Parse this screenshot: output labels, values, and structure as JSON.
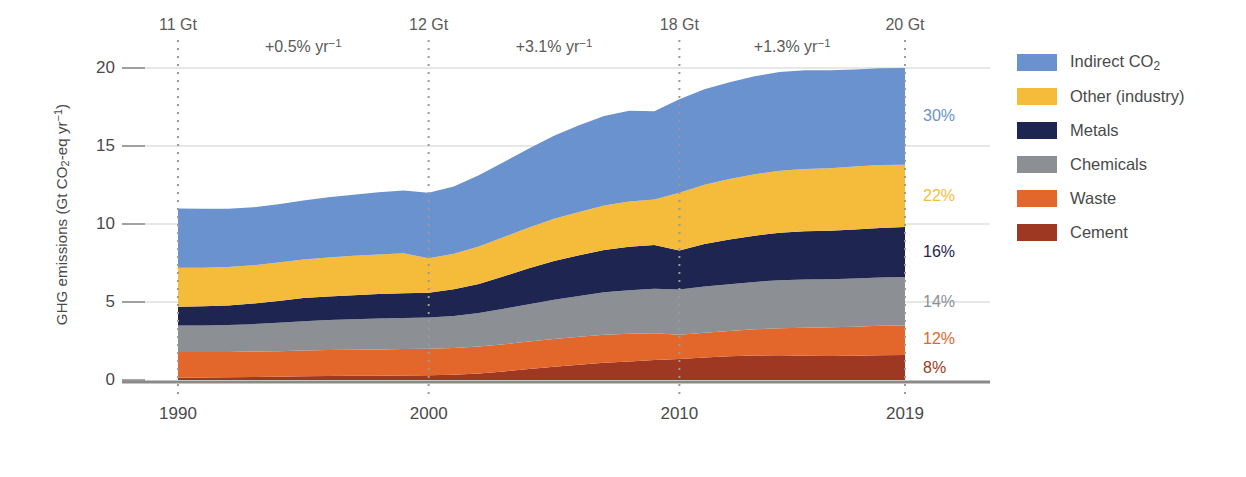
{
  "chart_data": {
    "type": "area",
    "stacked": true,
    "title": "",
    "xlabel": "",
    "ylabel": "GHG emissions (Gt CO2-eq yr-1)",
    "ylabel_parts": {
      "pre": "GHG emissions (Gt CO",
      "sub": "2",
      "mid": "-eq yr",
      "sup": "−1",
      "post": ")"
    },
    "xlim": [
      1990,
      2019
    ],
    "ylim": [
      0,
      21.5
    ],
    "yticks": [
      0,
      5,
      10,
      15,
      20
    ],
    "ytick_labels": [
      "0",
      "5",
      "10",
      "15",
      "20"
    ],
    "xticks": [
      1990,
      2000,
      2010,
      2019
    ],
    "xtick_labels": [
      "1990",
      "2000",
      "2010",
      "2019"
    ],
    "grid": "horizontal-light",
    "legend_position": "right",
    "x": [
      1990,
      1991,
      1992,
      1993,
      1994,
      1995,
      1996,
      1997,
      1998,
      1999,
      2000,
      2001,
      2002,
      2003,
      2004,
      2005,
      2006,
      2007,
      2008,
      2009,
      2010,
      2011,
      2012,
      2013,
      2014,
      2015,
      2016,
      2017,
      2018,
      2019
    ],
    "series": [
      {
        "name": "Cement",
        "color": "#9E3823",
        "end_share_pct": 8,
        "values": [
          0.15,
          0.16,
          0.17,
          0.19,
          0.21,
          0.24,
          0.26,
          0.27,
          0.28,
          0.29,
          0.3,
          0.34,
          0.42,
          0.55,
          0.7,
          0.85,
          0.98,
          1.1,
          1.18,
          1.28,
          1.35,
          1.45,
          1.52,
          1.57,
          1.58,
          1.55,
          1.54,
          1.55,
          1.58,
          1.6
        ]
      },
      {
        "name": "Waste",
        "color": "#E3672A",
        "end_share_pct": 12,
        "values": [
          1.65,
          1.64,
          1.63,
          1.63,
          1.64,
          1.65,
          1.66,
          1.67,
          1.68,
          1.69,
          1.7,
          1.71,
          1.72,
          1.74,
          1.76,
          1.78,
          1.79,
          1.8,
          1.78,
          1.72,
          1.55,
          1.58,
          1.62,
          1.68,
          1.74,
          1.8,
          1.84,
          1.87,
          1.89,
          1.9
        ]
      },
      {
        "name": "Chemicals",
        "color": "#8C9094",
        "end_share_pct": 14,
        "values": [
          1.7,
          1.7,
          1.72,
          1.76,
          1.82,
          1.88,
          1.92,
          1.95,
          1.98,
          2.0,
          2.0,
          2.06,
          2.16,
          2.28,
          2.4,
          2.52,
          2.62,
          2.72,
          2.8,
          2.85,
          2.9,
          2.96,
          3.0,
          3.04,
          3.08,
          3.1,
          3.08,
          3.08,
          3.1,
          3.1
        ]
      },
      {
        "name": "Metals",
        "color": "#1E2550",
        "end_share_pct": 16,
        "values": [
          1.2,
          1.22,
          1.26,
          1.32,
          1.4,
          1.48,
          1.52,
          1.55,
          1.57,
          1.58,
          1.6,
          1.7,
          1.86,
          2.08,
          2.3,
          2.48,
          2.6,
          2.72,
          2.78,
          2.8,
          2.5,
          2.72,
          2.86,
          2.96,
          3.04,
          3.08,
          3.1,
          3.14,
          3.18,
          3.2
        ]
      },
      {
        "name": "Other (industry)",
        "color": "#F5BC3C",
        "end_share_pct": 22,
        "values": [
          2.5,
          2.48,
          2.46,
          2.45,
          2.46,
          2.48,
          2.5,
          2.52,
          2.54,
          2.56,
          2.2,
          2.28,
          2.4,
          2.52,
          2.62,
          2.7,
          2.78,
          2.85,
          2.9,
          2.92,
          3.7,
          3.8,
          3.88,
          3.94,
          3.98,
          4.0,
          4.02,
          4.04,
          4.04,
          4.0
        ]
      },
      {
        "name": "Indirect CO2",
        "color": "#6A92CE",
        "end_share_pct": 30,
        "values": [
          3.8,
          3.78,
          3.74,
          3.72,
          3.74,
          3.78,
          3.85,
          3.92,
          3.98,
          4.02,
          4.2,
          4.32,
          4.56,
          4.8,
          5.06,
          5.32,
          5.56,
          5.74,
          5.82,
          5.66,
          6.0,
          6.12,
          6.2,
          6.28,
          6.32,
          6.32,
          6.28,
          6.22,
          6.2,
          6.2
        ]
      }
    ],
    "totals_by_year": [
      11.0,
      10.98,
      10.98,
      11.07,
      11.27,
      11.51,
      11.71,
      11.88,
      12.03,
      12.14,
      12.0,
      12.41,
      13.12,
      13.97,
      14.84,
      15.65,
      16.33,
      16.93,
      17.26,
      17.23,
      18.0,
      18.63,
      19.08,
      19.47,
      19.74,
      19.85,
      19.86,
      19.9,
      19.99,
      20.0
    ],
    "annotations": {
      "totals": [
        {
          "x": 1990,
          "label": "11 Gt"
        },
        {
          "x": 2000,
          "label": "12 Gt"
        },
        {
          "x": 2010,
          "label": "18 Gt"
        },
        {
          "x": 2019,
          "label": "20 Gt"
        }
      ],
      "rates": [
        {
          "x": 1995,
          "label": "+0.5% yr−1",
          "display": "+0.5% yr",
          "sup": "−1"
        },
        {
          "x": 2005,
          "label": "+3.1% yr−1",
          "display": "+3.1% yr",
          "sup": "−1"
        },
        {
          "x": 2014.5,
          "label": "+1.3% yr−1",
          "display": "+1.3% yr",
          "sup": "−1"
        }
      ],
      "end_shares": [
        {
          "label": "30%",
          "color": "#6A92CE",
          "value": 16.9
        },
        {
          "label": "22%",
          "color": "#F5BC3C",
          "value": 11.8
        },
        {
          "label": "16%",
          "color": "#1E2550",
          "value": 8.2
        },
        {
          "label": "14%",
          "color": "#8C9094",
          "value": 5.0
        },
        {
          "label": "12%",
          "color": "#E3672A",
          "value": 2.6
        },
        {
          "label": "8%",
          "color": "#9E3823",
          "value": 0.8
        }
      ],
      "vertical_markers": [
        1990,
        2000,
        2010,
        2019
      ]
    }
  },
  "legend": {
    "items": [
      {
        "label": "Indirect CO2",
        "text_pre": "Indirect CO",
        "text_sub": "2",
        "color": "#6A92CE"
      },
      {
        "label": "Other (industry)",
        "text_pre": "Other (industry)",
        "text_sub": "",
        "color": "#F5BC3C"
      },
      {
        "label": "Metals",
        "text_pre": "Metals",
        "text_sub": "",
        "color": "#1E2550"
      },
      {
        "label": "Chemicals",
        "text_pre": "Chemicals",
        "text_sub": "",
        "color": "#8C9094"
      },
      {
        "label": "Waste",
        "text_pre": "Waste",
        "text_sub": "",
        "color": "#E3672A"
      },
      {
        "label": "Cement",
        "text_pre": "Cement",
        "text_sub": "",
        "color": "#9E3823"
      }
    ]
  }
}
